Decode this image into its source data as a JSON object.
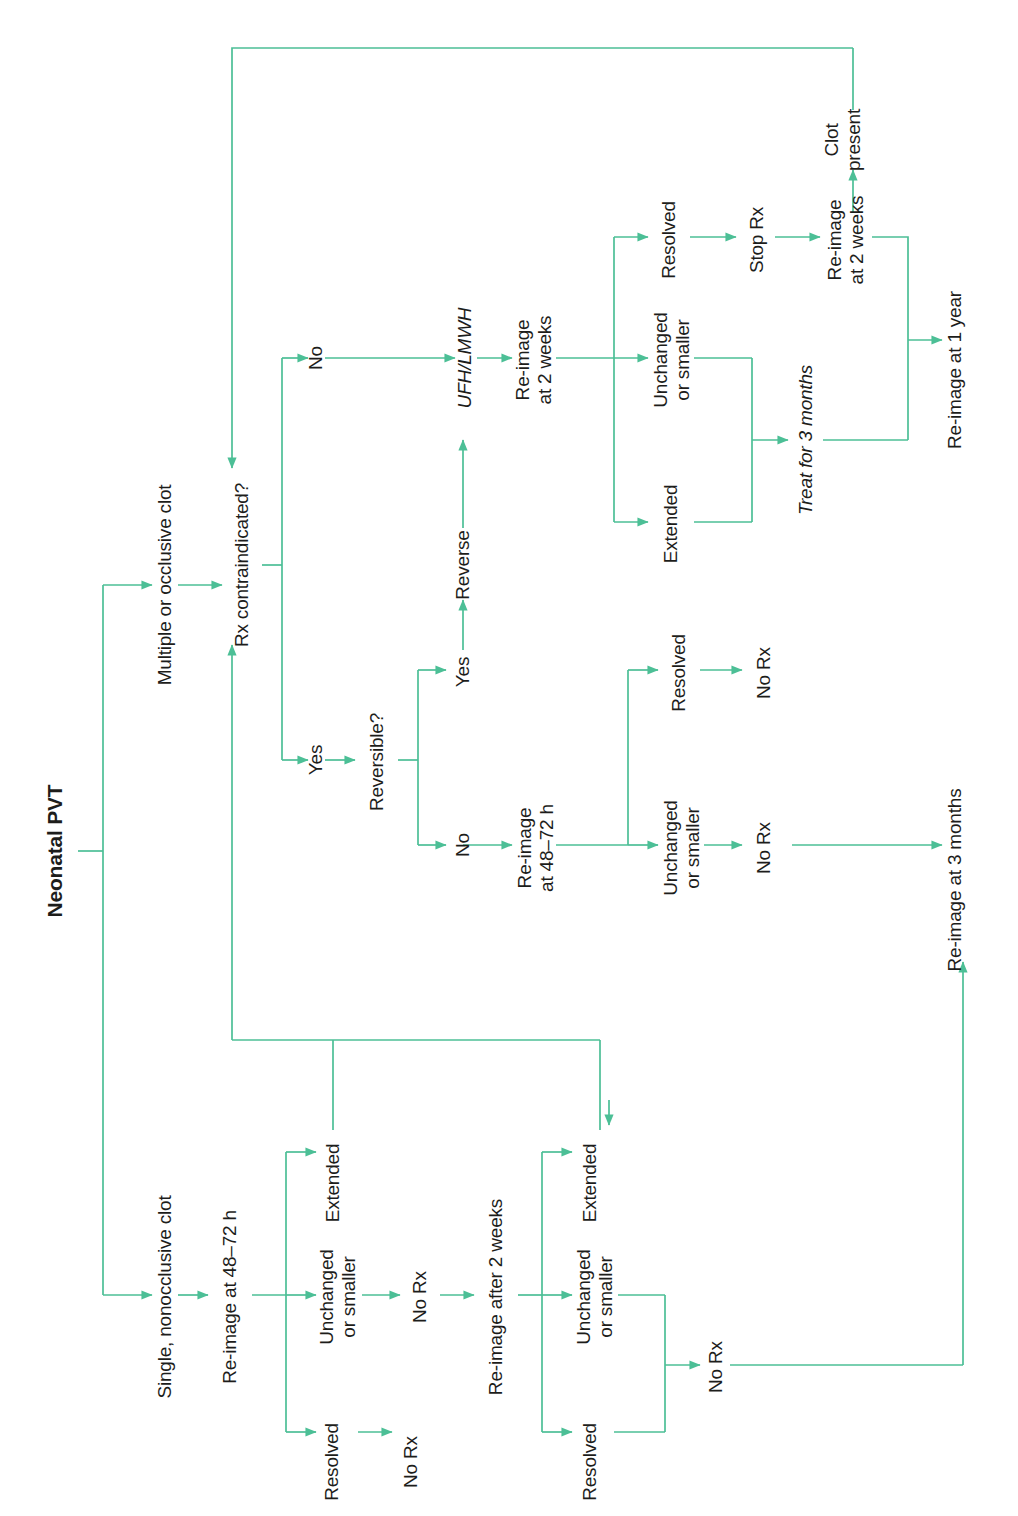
{
  "figure": {
    "type": "flowchart",
    "orientation": "rotated-90-ccw",
    "title": "Neonatal PVT",
    "accent_color": "#4cbf96",
    "text_color": "#1d1d1b",
    "background": "#ffffff"
  },
  "nodes": {
    "title": "Neonatal PVT",
    "multiple_or_occlusive_clot": "Multiple or occlusive clot",
    "rx_contraindicated": "Rx contraindicated?",
    "branch_no_top": "No",
    "branch_yes_bottom": "Yes",
    "reversible": "Reversible?",
    "reversible_yes": "Yes",
    "reversible_no": "No",
    "reverse": "Reverse",
    "ufh_lmwh": "UFH/LMWH",
    "reimage_2weeks_upper": "Re-image\nat 2 weeks",
    "resolved_upper": "Resolved",
    "unchanged_or_smaller_upper": "Unchanged\nor smaller",
    "extended_upper": "Extended",
    "stop_rx": "Stop Rx",
    "reimage_2weeks_stoprx": "Re-image\nat 2 weeks",
    "clot_present": "Clot\npresent",
    "treat_for_3_months": "Treat for 3 months",
    "reimage_1_year": "Re-image at 1 year",
    "reimage_48_72_mid": "Re-image\nat 48–72 h",
    "resolved_mid": "Resolved",
    "no_rx_mid_resolved": "No Rx",
    "unchanged_or_smaller_mid": "Unchanged\nor smaller",
    "no_rx_mid_unchanged": "No Rx",
    "reimage_3_months": "Re-image at 3 months",
    "single_nonocclusive_clot": "Single, nonocclusive clot",
    "reimage_48_72_lower": "Re-image at 48–72 h",
    "extended_lower1": "Extended",
    "unchanged_or_smaller_lower1": "Unchanged\nor smaller",
    "no_rx_lower1": "No Rx",
    "resolved_lower1": "Resolved",
    "no_rx_lower1_resolved": "No Rx",
    "reimage_after_2_weeks": "Re-image after 2 weeks",
    "extended_lower2": "Extended",
    "unchanged_or_smaller_lower2": "Unchanged\nor smaller",
    "resolved_lower2": "Resolved",
    "no_rx_lower2": "No Rx"
  },
  "edges": [
    {
      "from": "title",
      "to": "multiple_or_occlusive_clot"
    },
    {
      "from": "title",
      "to": "single_nonocclusive_clot"
    },
    {
      "from": "multiple_or_occlusive_clot",
      "to": "rx_contraindicated"
    },
    {
      "from": "rx_contraindicated",
      "to": "branch_no_top",
      "label": "No"
    },
    {
      "from": "rx_contraindicated",
      "to": "branch_yes_bottom",
      "label": "Yes"
    },
    {
      "from": "branch_no_top",
      "to": "ufh_lmwh"
    },
    {
      "from": "branch_yes_bottom",
      "to": "reversible"
    },
    {
      "from": "reversible",
      "to": "reversible_yes",
      "label": "Yes"
    },
    {
      "from": "reversible",
      "to": "reversible_no",
      "label": "No"
    },
    {
      "from": "reversible_yes",
      "to": "reverse"
    },
    {
      "from": "reverse",
      "to": "ufh_lmwh"
    },
    {
      "from": "ufh_lmwh",
      "to": "reimage_2weeks_upper"
    },
    {
      "from": "reimage_2weeks_upper",
      "to": "resolved_upper"
    },
    {
      "from": "reimage_2weeks_upper",
      "to": "unchanged_or_smaller_upper"
    },
    {
      "from": "reimage_2weeks_upper",
      "to": "extended_upper"
    },
    {
      "from": "resolved_upper",
      "to": "stop_rx"
    },
    {
      "from": "stop_rx",
      "to": "reimage_2weeks_stoprx"
    },
    {
      "from": "reimage_2weeks_stoprx",
      "to": "clot_present"
    },
    {
      "from": "clot_present",
      "to": "rx_contraindicated"
    },
    {
      "from": "reimage_2weeks_stoprx",
      "to": "reimage_1_year"
    },
    {
      "from": "unchanged_or_smaller_upper",
      "to": "treat_for_3_months"
    },
    {
      "from": "extended_upper",
      "to": "treat_for_3_months"
    },
    {
      "from": "treat_for_3_months",
      "to": "reimage_1_year"
    },
    {
      "from": "reversible_no",
      "to": "reimage_48_72_mid"
    },
    {
      "from": "reimage_48_72_mid",
      "to": "resolved_mid"
    },
    {
      "from": "reimage_48_72_mid",
      "to": "unchanged_or_smaller_mid"
    },
    {
      "from": "resolved_mid",
      "to": "no_rx_mid_resolved"
    },
    {
      "from": "unchanged_or_smaller_mid",
      "to": "no_rx_mid_unchanged"
    },
    {
      "from": "no_rx_mid_unchanged",
      "to": "reimage_3_months"
    },
    {
      "from": "single_nonocclusive_clot",
      "to": "reimage_48_72_lower"
    },
    {
      "from": "reimage_48_72_lower",
      "to": "extended_lower1"
    },
    {
      "from": "reimage_48_72_lower",
      "to": "unchanged_or_smaller_lower1"
    },
    {
      "from": "reimage_48_72_lower",
      "to": "resolved_lower1"
    },
    {
      "from": "extended_lower1",
      "to": "rx_contraindicated"
    },
    {
      "from": "unchanged_or_smaller_lower1",
      "to": "no_rx_lower1"
    },
    {
      "from": "no_rx_lower1",
      "to": "reimage_after_2_weeks"
    },
    {
      "from": "resolved_lower1",
      "to": "no_rx_lower1_resolved"
    },
    {
      "from": "reimage_after_2_weeks",
      "to": "extended_lower2"
    },
    {
      "from": "reimage_after_2_weeks",
      "to": "unchanged_or_smaller_lower2"
    },
    {
      "from": "reimage_after_2_weeks",
      "to": "resolved_lower2"
    },
    {
      "from": "extended_lower2",
      "to": "rx_contraindicated"
    },
    {
      "from": "unchanged_or_smaller_lower2",
      "to": "no_rx_lower2"
    },
    {
      "from": "resolved_lower2",
      "to": "no_rx_lower2"
    },
    {
      "from": "no_rx_lower2",
      "to": "reimage_3_months"
    }
  ]
}
